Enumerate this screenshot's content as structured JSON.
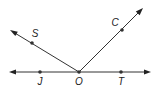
{
  "diagram": {
    "type": "geometry-rays",
    "colors": {
      "line": "#333333",
      "text": "#222222",
      "background": "#ffffff"
    },
    "line": {
      "name": "line JT",
      "from": [
        9,
        72
      ],
      "to": [
        151,
        72
      ],
      "arrows": "both"
    },
    "rays": [
      {
        "name": "ray OS",
        "from": [
          79,
          72
        ],
        "to": [
          10,
          30
        ]
      },
      {
        "name": "ray OC",
        "from": [
          79,
          72
        ],
        "to": [
          143,
          8
        ]
      }
    ],
    "points": [
      {
        "id": "J",
        "label": "J",
        "x": 40,
        "y": 72,
        "lx": 40,
        "ly": 84
      },
      {
        "id": "O",
        "label": "O",
        "x": 79,
        "y": 72,
        "lx": 79,
        "ly": 84
      },
      {
        "id": "T",
        "label": "T",
        "x": 121,
        "y": 72,
        "lx": 121,
        "ly": 84
      },
      {
        "id": "S",
        "label": "S",
        "x": 32,
        "y": 43,
        "lx": 35,
        "ly": 36
      },
      {
        "id": "C",
        "label": "C",
        "x": 122,
        "y": 30,
        "lx": 115,
        "ly": 25
      }
    ]
  }
}
